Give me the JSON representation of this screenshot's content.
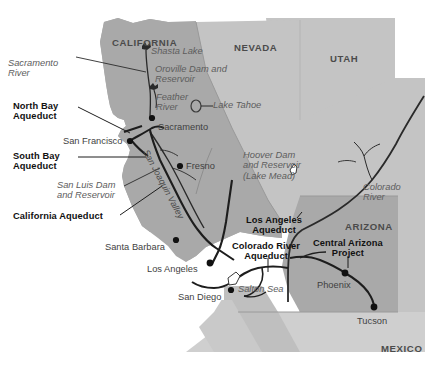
{
  "map": {
    "title": "Southwestern United States Water Projects Map",
    "colors": {
      "state_dark": "#a9a9a9",
      "state_light": "#c4c4c4",
      "state_mid": "#b8b8b8",
      "ocean": "#ffffff",
      "line_dark": "#1d1d1d",
      "line_gray": "#6e6e6e",
      "label_black": "#111111",
      "label_gray": "#5d5d5d",
      "label_city": "#3f3f3f",
      "label_state": "#4b4b4b"
    },
    "states": [
      {
        "name": "CALIFORNIA",
        "x": 112,
        "y": 38
      },
      {
        "name": "NEVADA",
        "x": 234,
        "y": 43
      },
      {
        "name": "UTAH",
        "x": 330,
        "y": 54
      },
      {
        "name": "ARIZONA",
        "x": 345,
        "y": 222
      },
      {
        "name": "MEXICO",
        "x": 381,
        "y": 344
      }
    ],
    "cities": [
      {
        "name": "Sacramento",
        "label_x": 156,
        "label_y": 126,
        "dot_x": 152,
        "dot_y": 118,
        "align": "left"
      },
      {
        "name": "San Francisco",
        "label_x": 63,
        "label_y": 136,
        "dot_x": 130,
        "dot_y": 141,
        "align": "left"
      },
      {
        "name": "Fresno",
        "label_x": 186,
        "label_y": 169,
        "dot_x": 180,
        "dot_y": 166,
        "align": "left"
      },
      {
        "name": "Santa Barbara",
        "label_x": 105,
        "label_y": 246,
        "dot_x": 176,
        "dot_y": 240,
        "align": "left"
      },
      {
        "name": "Los Angeles",
        "label_x": 147,
        "label_y": 268,
        "dot_x": 210,
        "dot_y": 263,
        "align": "left"
      },
      {
        "name": "San Diego",
        "label_x": 178,
        "label_y": 296,
        "dot_x": 231,
        "dot_y": 290,
        "align": "left"
      },
      {
        "name": "Phoenix",
        "label_x": 317,
        "label_y": 284,
        "dot_x": 345,
        "dot_y": 273,
        "align": "left"
      },
      {
        "name": "Tucson",
        "label_x": 357,
        "label_y": 320,
        "dot_x": 374,
        "dot_y": 307,
        "align": "left"
      }
    ],
    "water_features": [
      {
        "name": "Sacramento\nRiver",
        "x": 8,
        "y": 58
      },
      {
        "name": "Shasta Lake",
        "x": 151,
        "y": 51
      },
      {
        "name": "Oroville Dam and\nReservoir",
        "x": 155,
        "y": 68
      },
      {
        "name": "Feather\nRiver",
        "x": 156,
        "y": 96
      },
      {
        "name": "Lake Tahoe",
        "x": 205,
        "y": 104
      },
      {
        "name": "San Luis Dam\nand Reservoir",
        "x": 57,
        "y": 185
      },
      {
        "name": "Hoover Dam\nand Reservoir\n(Lake Mead)",
        "x": 243,
        "y": 154
      },
      {
        "name": "Colorado\nRiver",
        "x": 363,
        "y": 186
      },
      {
        "name": "Salton Sea",
        "x": 238,
        "y": 288
      },
      {
        "name": "San Joaquin Valley",
        "x": 150,
        "y": 148
      }
    ],
    "aqueducts": [
      {
        "name": "North Bay\nAqueduct",
        "x": 13,
        "y": 105
      },
      {
        "name": "South Bay\nAqueduct",
        "x": 13,
        "y": 155
      },
      {
        "name": "California Aqueduct",
        "x": 13,
        "y": 216
      },
      {
        "name": "Los Angeles\nAqueduct",
        "x": 246,
        "y": 219
      },
      {
        "name": "Colorado River\nAqueduct",
        "x": 232,
        "y": 245
      },
      {
        "name": "Central Arizona\nProject",
        "x": 313,
        "y": 242
      }
    ]
  }
}
